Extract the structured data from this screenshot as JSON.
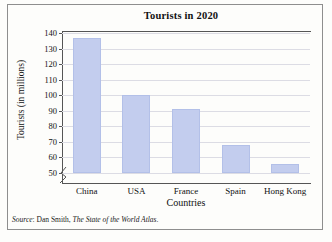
{
  "chart_data": {
    "type": "bar",
    "title": "Tourists in 2020",
    "xlabel": "Countries",
    "ylabel": "Tourists (in millions)",
    "categories": [
      "China",
      "USA",
      "France",
      "Spain",
      "Hong Kong"
    ],
    "values": [
      137,
      100,
      91,
      68,
      56
    ],
    "ylim": [
      50,
      140
    ],
    "ytick_labels": [
      "140",
      "130",
      "120",
      "110",
      "100",
      "90",
      "80",
      "70",
      "60",
      "50"
    ],
    "ytick_values": [
      140,
      130,
      120,
      110,
      100,
      90,
      80,
      70,
      60,
      50
    ],
    "grid": true,
    "axis_break": true,
    "legend": "none",
    "bar_color": "#c3cdee",
    "bar_edge_color": "#b3c0e8",
    "gridline_color": "#dcdce4",
    "axis_color": "#555555"
  },
  "source": {
    "prefix": "Source",
    "separator": ": ",
    "author": "Dan Smith, ",
    "work": "The State of the World Atlas",
    "end": "."
  }
}
